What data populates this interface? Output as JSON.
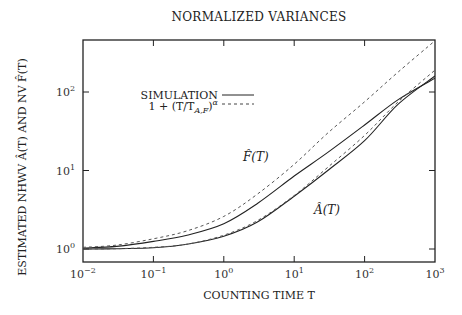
{
  "chart_data": {
    "type": "line",
    "title": "NORMALIZED VARIANCES",
    "xlabel": "COUNTING TIME T",
    "ylabel": "ESTIMATED NHWV Â(T) AND NV F̂(T)",
    "xscale": "log",
    "yscale": "log",
    "xlim": [
      0.01,
      1000
    ],
    "ylim": [
      0.85,
      460
    ],
    "x_ticks": [
      "10^-2",
      "10^-1",
      "10^0",
      "10^1",
      "10^2",
      "10^3"
    ],
    "y_ticks": [
      "10^0",
      "10^1",
      "10^2"
    ],
    "grid": false,
    "legend": {
      "position": "upper left",
      "entries": [
        {
          "label": "SIMULATION",
          "style": "solid"
        },
        {
          "label": "1 + (T/T_{A,F})^α",
          "style": "dashed"
        }
      ]
    },
    "annotations": [
      {
        "text": "F̂(T)",
        "x": 3,
        "y": 20
      },
      {
        "text": "Â(T)",
        "x": 30,
        "y": 2.5
      }
    ],
    "x": [
      0.01,
      0.03,
      0.1,
      0.3,
      1,
      3,
      10,
      30,
      100,
      300,
      1000
    ],
    "series": [
      {
        "name": "F̂(T) simulation",
        "style": "solid",
        "values": [
          1.03,
          1.08,
          1.25,
          1.5,
          2.1,
          3.8,
          8.5,
          17,
          38,
          80,
          150
        ]
      },
      {
        "name": "F̂(T) theory 1+(T/T_F)^α",
        "style": "dashed",
        "values": [
          1.05,
          1.12,
          1.35,
          1.7,
          2.6,
          5.0,
          12,
          30,
          75,
          180,
          450
        ]
      },
      {
        "name": "Â(T) simulation",
        "style": "solid",
        "values": [
          1.0,
          1.01,
          1.04,
          1.15,
          1.45,
          2.2,
          4.7,
          10,
          24,
          70,
          160
        ]
      },
      {
        "name": "Â(T) theory 1+(T/T_A)^α",
        "style": "dashed",
        "values": [
          1.0,
          1.01,
          1.05,
          1.15,
          1.5,
          2.3,
          4.8,
          11,
          28,
          75,
          190
        ]
      }
    ]
  },
  "labels": {
    "title": "NORMALIZED VARIANCES",
    "xlabel": "COUNTING TIME T",
    "ylabel": "ESTIMATED NHWV Â(T) AND NV F̂(T)",
    "legend_sim": "SIMULATION",
    "legend_theory": "1 + (T/T",
    "legend_theory_sub": "A,F",
    "legend_theory_tail": ")",
    "legend_theory_exp": "α",
    "label_F": "F̂(T)",
    "label_A": "Â(T)"
  }
}
